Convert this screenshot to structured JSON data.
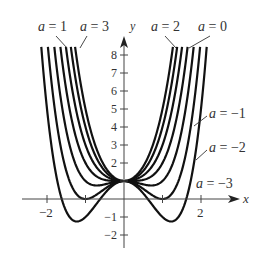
{
  "chart_data": {
    "type": "line",
    "title": "",
    "function": "f(x) = x^4 + a x^2 + 1",
    "xlabel": "x",
    "ylabel": "y",
    "xlim": [
      -2.3,
      2.8
    ],
    "ylim": [
      -2.3,
      8.8
    ],
    "grid": false,
    "x_ticks": [
      -2,
      -1,
      1,
      2
    ],
    "x_tick_labels": [
      "−2",
      "2"
    ],
    "x_tick_label_values": [
      -2,
      2
    ],
    "y_ticks": [
      -2,
      -1,
      1,
      2,
      3,
      4,
      5,
      6,
      7,
      8
    ],
    "y_tick_labels": [
      "−2",
      "−1",
      "2",
      "3",
      "4",
      "5",
      "6",
      "7",
      "8"
    ],
    "y_tick_label_values": [
      -2,
      -1,
      2,
      3,
      4,
      5,
      6,
      7,
      8
    ],
    "series": [
      {
        "name": "a = 3",
        "a": 3
      },
      {
        "name": "a = 2",
        "a": 2
      },
      {
        "name": "a = 1",
        "a": 1
      },
      {
        "name": "a = 0",
        "a": 0
      },
      {
        "name": "a = −1",
        "a": -1
      },
      {
        "name": "a = −2",
        "a": -2
      },
      {
        "name": "a = −3",
        "a": -3
      }
    ],
    "annotations": [
      {
        "text": "a = 1",
        "x": 38,
        "y": 31,
        "pointer": [
          [
            56,
            36
          ],
          [
            67,
            48
          ]
        ]
      },
      {
        "text": "a = 3",
        "x": 80,
        "y": 31,
        "pointer": [
          [
            87,
            36
          ],
          [
            80,
            48
          ]
        ]
      },
      {
        "text": "a = 2",
        "x": 151,
        "y": 31,
        "pointer": [
          [
            165,
            36
          ],
          [
            176,
            48
          ]
        ]
      },
      {
        "text": "a = 0",
        "x": 198,
        "y": 31,
        "pointer": [
          [
            210,
            36
          ],
          [
            189,
            48
          ]
        ]
      },
      {
        "text": "a = −1",
        "x": 209,
        "y": 118,
        "pointer": [
          [
            207,
            116
          ],
          [
            194,
            126
          ]
        ]
      },
      {
        "text": "a = −2",
        "x": 209,
        "y": 152,
        "pointer": [
          [
            207,
            150
          ],
          [
            196,
            160
          ]
        ]
      },
      {
        "text": "a = −3",
        "x": 196,
        "y": 188,
        "pointer": null
      }
    ]
  },
  "labels": {
    "x_axis": "x",
    "y_axis": "y"
  }
}
